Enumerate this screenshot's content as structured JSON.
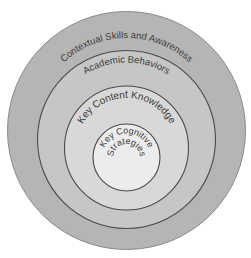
{
  "diagram": {
    "type": "nested-circles",
    "layers": [
      {
        "id": "outer",
        "label": "Contextual Skills and Awareness",
        "fill": "#b5b5b5",
        "stroke": "#7a7a7a",
        "cx": 126.5,
        "cy": 130.5,
        "r": 119,
        "label_radius": 104,
        "label_font_size": 9.5
      },
      {
        "id": "second",
        "label": "Academic Behaviors",
        "fill": "#c6c6c6",
        "stroke": "#4a4a4a",
        "cx": 126.5,
        "cy": 139.5,
        "r": 89,
        "label_radius": 75,
        "label_font_size": 9.5
      },
      {
        "id": "third",
        "label": "Key Content Knowledge",
        "fill": "#d8d8d8",
        "stroke": "#4a4a4a",
        "cx": 126.5,
        "cy": 148,
        "r": 62,
        "label_radius": 49,
        "label_font_size": 10
      },
      {
        "id": "inner",
        "label_line1": "Key Cognitive",
        "label_line2": "Strategies",
        "fill": "#ececec",
        "stroke": "#4a4a4a",
        "cx": 126.5,
        "cy": 157.5,
        "r": 33.5,
        "label_radius": 23,
        "label2_radius": 13,
        "label_font_size": 9.5
      }
    ]
  },
  "labels": {
    "outer": "Contextual Skills and Awareness",
    "second": "Academic Behaviors",
    "third": "Key Content Knowledge",
    "inner_line1": "Key Cognitive",
    "inner_line2": "Strategies"
  }
}
